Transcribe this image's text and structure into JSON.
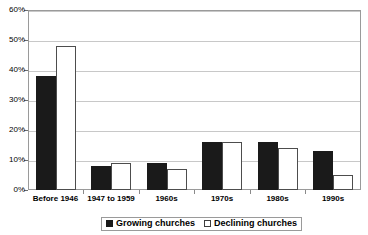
{
  "chart_data": {
    "type": "bar",
    "title": "",
    "xlabel": "",
    "ylabel": "",
    "ylim": [
      0,
      60
    ],
    "ytick_values": [
      0,
      10,
      20,
      30,
      40,
      50,
      60
    ],
    "ytick_labels": [
      "0%",
      "10%",
      "20%",
      "30%",
      "40%",
      "50%",
      "60%"
    ],
    "grid": true,
    "legend_position": "bottom",
    "categories": [
      "Before 1946",
      "1947 to 1959",
      "1960s",
      "1970s",
      "1980s",
      "1990s"
    ],
    "series": [
      {
        "name": "Growing churches",
        "color": "#1a1a1a",
        "fill": "solid",
        "values": [
          38,
          8,
          9,
          16,
          16,
          13
        ]
      },
      {
        "name": "Declining churches",
        "color": "#ffffff",
        "fill": "hollow",
        "values": [
          48,
          9,
          7,
          16,
          14,
          5
        ]
      }
    ]
  },
  "legend": {
    "items": [
      {
        "label": "Growing churches",
        "swatch": "filled-square-icon"
      },
      {
        "label": "Declining churches",
        "swatch": "hollow-square-icon"
      }
    ]
  }
}
